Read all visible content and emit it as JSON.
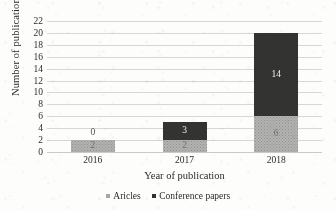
{
  "chart_data": {
    "type": "bar",
    "subtype": "stacked-bar",
    "title": "",
    "xlabel": "Year of publication",
    "ylabel": "Number of publications",
    "categories": [
      "2016",
      "2017",
      "2018"
    ],
    "series": [
      {
        "name": "Aricles",
        "values": [
          2,
          2,
          6
        ],
        "color": "#b4b4b2",
        "pattern": "dotted"
      },
      {
        "name": "Conference papers",
        "values": [
          0,
          3,
          14
        ],
        "color": "#333331",
        "pattern": "solid"
      }
    ],
    "totals": [
      2,
      5,
      20
    ],
    "ylim": [
      0,
      22
    ],
    "ytick_step": 2,
    "yticks": [
      "0",
      "2",
      "4",
      "6",
      "8",
      "10",
      "12",
      "14",
      "16",
      "18",
      "20",
      "22"
    ],
    "grid": "horizontal",
    "legend_position": "bottom-center",
    "data_labels": {
      "2016": {
        "articles": "2",
        "conference": "0",
        "conference_label_above_bar": true
      },
      "2017": {
        "articles": "2",
        "conference": "3"
      },
      "2018": {
        "articles": "6",
        "conference": "14"
      }
    }
  },
  "axis": {
    "y_title": "Number of publications",
    "x_title": "Year of publication"
  },
  "legend": {
    "items": [
      {
        "label": "Aricles",
        "swatch": "articles-swatch"
      },
      {
        "label": "Conference papers",
        "swatch": "conference-swatch"
      }
    ]
  }
}
